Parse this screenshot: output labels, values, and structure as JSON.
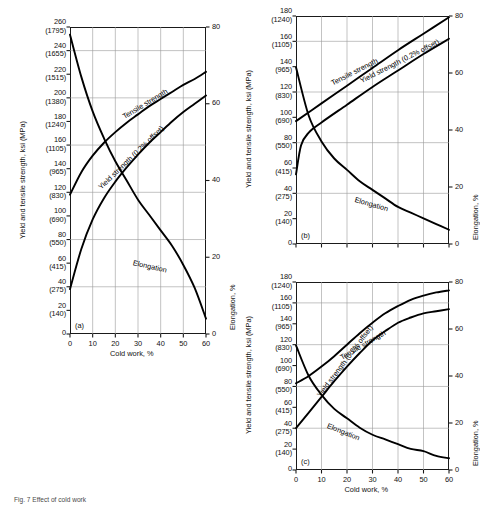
{
  "figure": {
    "caption": "Fig. 7  Effect of cold work",
    "axis_titles": {
      "x": "Cold work, %",
      "y_left": "Yield and tensile strength, ksi (MPa)",
      "y_right": "Elongation, %"
    },
    "curve_names": {
      "tensile": "Tensile strength",
      "yield": "Yield strength (0.2% offset)",
      "elongation": "Elongation"
    }
  },
  "chart_data": [
    {
      "type": "line",
      "panel": "(a)",
      "title": "",
      "xlabel": "Cold work, %",
      "ylabel": "Yield and tensile strength, ksi (MPa)",
      "y2label": "Elongation, %",
      "xlim": [
        0,
        60
      ],
      "ylim": [
        0,
        260
      ],
      "y2lim": [
        0,
        80
      ],
      "grid": true,
      "xticks": [
        0,
        10,
        20,
        30,
        40,
        50,
        60
      ],
      "yticks_ksi": [
        0,
        20,
        40,
        60,
        80,
        100,
        120,
        140,
        160,
        180,
        200,
        220,
        240,
        260
      ],
      "yticks_mpa": [
        0,
        140,
        275,
        415,
        550,
        690,
        830,
        965,
        1105,
        1240,
        1380,
        1515,
        1655,
        1795
      ],
      "y2ticks": [
        0,
        20,
        40,
        60,
        80
      ],
      "series": [
        {
          "name": "Tensile strength",
          "axis": "left",
          "x": [
            0,
            5,
            10,
            15,
            20,
            25,
            30,
            35,
            40,
            45,
            50,
            55,
            60
          ],
          "values": [
            118,
            137,
            151,
            162,
            171,
            179,
            186,
            193,
            199,
            205,
            211,
            216,
            222
          ]
        },
        {
          "name": "Yield strength (0.2% offset)",
          "axis": "left",
          "x": [
            0,
            5,
            10,
            15,
            20,
            25,
            30,
            35,
            40,
            45,
            50,
            55,
            60
          ],
          "values": [
            38,
            72,
            97,
            115,
            129,
            141,
            152,
            162,
            171,
            180,
            188,
            195,
            202
          ]
        },
        {
          "name": "Elongation",
          "axis": "right",
          "x": [
            0,
            5,
            10,
            15,
            20,
            25,
            30,
            35,
            40,
            45,
            50,
            55,
            60
          ],
          "values": [
            78,
            67,
            58,
            51,
            45,
            40,
            35,
            31,
            27,
            23,
            18,
            12,
            4
          ]
        }
      ]
    },
    {
      "type": "line",
      "panel": "(b)",
      "title": "",
      "xlabel": "",
      "ylabel": "Yield and tensile strength, ksi (MPa)",
      "y2label": "Elongation, %",
      "xlim": [
        0,
        60
      ],
      "ylim": [
        0,
        180
      ],
      "y2lim": [
        0,
        80
      ],
      "grid": true,
      "xticks": [
        0,
        10,
        20,
        30,
        40,
        50,
        60
      ],
      "yticks_ksi": [
        0,
        20,
        40,
        60,
        80,
        100,
        120,
        140,
        160,
        180
      ],
      "yticks_mpa": [
        0,
        140,
        275,
        415,
        550,
        690,
        830,
        965,
        1105,
        1240
      ],
      "y2ticks": [
        0,
        20,
        40,
        60,
        80
      ],
      "series": [
        {
          "name": "Tensile strength",
          "axis": "left",
          "x": [
            0,
            10,
            20,
            30,
            40,
            50,
            60
          ],
          "values": [
            97,
            111,
            125,
            139,
            153,
            166,
            179
          ]
        },
        {
          "name": "Yield strength (0.2% offset)",
          "axis": "left",
          "x": [
            0,
            2,
            5,
            10,
            20,
            30,
            40,
            50,
            60
          ],
          "values": [
            55,
            78,
            88,
            96,
            110,
            124,
            137,
            150,
            162
          ]
        },
        {
          "name": "Elongation",
          "axis": "right",
          "x": [
            0,
            5,
            10,
            15,
            20,
            25,
            30,
            35,
            40,
            45,
            50,
            55,
            60
          ],
          "values": [
            62,
            45,
            36,
            30,
            26,
            22,
            19,
            16,
            13,
            11,
            9,
            7,
            5
          ]
        }
      ]
    },
    {
      "type": "line",
      "panel": "(c)",
      "title": "",
      "xlabel": "Cold work, %",
      "ylabel": "Yield and tensile strength, ksi (MPa)",
      "y2label": "Elongation, %",
      "xlim": [
        0,
        60
      ],
      "ylim": [
        0,
        180
      ],
      "y2lim": [
        0,
        80
      ],
      "grid": true,
      "xticks": [
        0,
        10,
        20,
        30,
        40,
        50,
        60
      ],
      "yticks_ksi": [
        0,
        20,
        40,
        60,
        80,
        100,
        120,
        140,
        160,
        180
      ],
      "yticks_mpa": [
        0,
        140,
        275,
        415,
        550,
        690,
        830,
        965,
        1105,
        1240
      ],
      "y2ticks": [
        0,
        20,
        40,
        60,
        80
      ],
      "series": [
        {
          "name": "Tensile strength",
          "axis": "left",
          "x": [
            0,
            5,
            10,
            15,
            20,
            25,
            30,
            35,
            40,
            45,
            50,
            55,
            60
          ],
          "values": [
            83,
            90,
            99,
            109,
            120,
            131,
            141,
            150,
            157,
            163,
            167,
            170,
            172
          ]
        },
        {
          "name": "Yield strength (0.2% offset)",
          "axis": "left",
          "x": [
            0,
            5,
            10,
            15,
            20,
            25,
            30,
            35,
            40,
            45,
            50,
            55,
            60
          ],
          "values": [
            40,
            55,
            70,
            85,
            99,
            112,
            124,
            133,
            141,
            146,
            150,
            152,
            154
          ]
        },
        {
          "name": "Elongation",
          "axis": "right",
          "x": [
            0,
            5,
            10,
            15,
            20,
            25,
            30,
            35,
            40,
            45,
            50,
            55,
            60
          ],
          "values": [
            53,
            40,
            32,
            26,
            22,
            18,
            15,
            13,
            11,
            9,
            8,
            6,
            5
          ]
        }
      ]
    }
  ]
}
